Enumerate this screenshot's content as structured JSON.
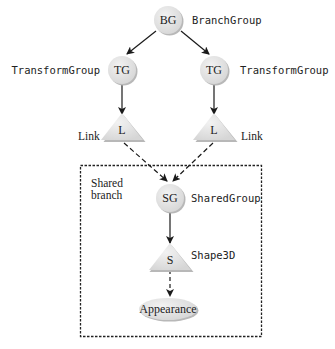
{
  "diagram": {
    "nodes": {
      "bg": {
        "symbol": "BG",
        "label": "BranchGroup"
      },
      "tg_left": {
        "symbol": "TG",
        "label": "TransformGroup"
      },
      "tg_right": {
        "symbol": "TG",
        "label": "TransformGroup"
      },
      "link_left": {
        "symbol": "L",
        "label": "Link"
      },
      "link_right": {
        "symbol": "L",
        "label": "Link"
      },
      "sg": {
        "symbol": "SG",
        "label": "SharedGroup"
      },
      "shape": {
        "symbol": "S",
        "label": "Shape3D"
      },
      "appearance": {
        "symbol": "Appearance"
      }
    },
    "region": {
      "label_line1": "Shared",
      "label_line2": "branch"
    },
    "edges": [
      {
        "from": "bg",
        "to": "tg_left",
        "style": "solid"
      },
      {
        "from": "bg",
        "to": "tg_right",
        "style": "solid"
      },
      {
        "from": "tg_left",
        "to": "link_left",
        "style": "solid"
      },
      {
        "from": "tg_right",
        "to": "link_right",
        "style": "solid"
      },
      {
        "from": "link_left",
        "to": "sg",
        "style": "dashed"
      },
      {
        "from": "link_right",
        "to": "sg",
        "style": "dashed"
      },
      {
        "from": "sg",
        "to": "shape",
        "style": "solid"
      },
      {
        "from": "shape",
        "to": "appearance",
        "style": "dashed"
      }
    ],
    "colors": {
      "node_fill": "#e4e4e4",
      "node_shadow": "#b8b8b8",
      "line": "#1a1a1a"
    }
  }
}
